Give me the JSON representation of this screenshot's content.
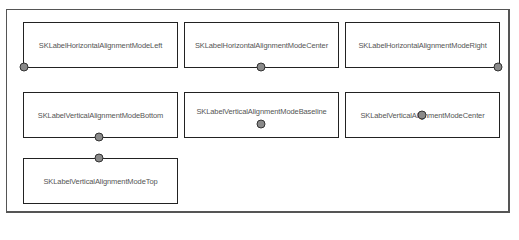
{
  "diagram": {
    "boxes": [
      {
        "label": "SKLabelHorizontalAlignmentModeLeft"
      },
      {
        "label": "SKLabelHorizontalAlignmentModeCenter"
      },
      {
        "label": "SKLabelHorizontalAlignmentModeRight"
      },
      {
        "label": "SKLabelVerticalAlignmentModeBottom"
      },
      {
        "label": "SKLabelVerticalAlignmentModeBaseline"
      },
      {
        "label": "SKLabelVerticalAlignmentModeCenter"
      },
      {
        "label": "SKLabelVerticalAlignmentModeTop"
      }
    ],
    "colors": {
      "border": "#222222",
      "anchor_fill": "#8a8a8a",
      "text": "#555555"
    }
  }
}
